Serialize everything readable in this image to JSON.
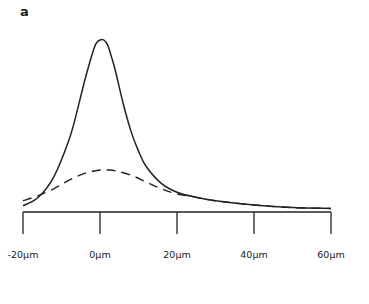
{
  "panel_label": "a",
  "chart_data": {
    "type": "line",
    "title": "",
    "xlabel": "",
    "ylabel": "",
    "x_ticks": [
      "-20µm",
      "0µm",
      "20µm",
      "40µm",
      "60µm"
    ],
    "x_tick_values": [
      -20,
      0,
      20,
      40,
      60
    ],
    "xlim": [
      -20,
      60
    ],
    "grid": false,
    "legend": null,
    "series": [
      {
        "name": "solid",
        "style": "solid",
        "x": [
          -20,
          -16,
          -12,
          -8,
          -6,
          -4,
          -2,
          -1,
          0,
          1,
          2,
          3,
          4,
          6,
          8,
          10,
          12,
          16,
          20,
          25,
          30,
          40,
          50,
          60
        ],
        "y": [
          0.03,
          0.08,
          0.2,
          0.42,
          0.58,
          0.76,
          0.92,
          0.98,
          1.0,
          1.0,
          0.97,
          0.9,
          0.82,
          0.63,
          0.47,
          0.35,
          0.26,
          0.16,
          0.11,
          0.08,
          0.06,
          0.035,
          0.02,
          0.015
        ]
      },
      {
        "name": "dashed",
        "style": "dashed",
        "x": [
          -20,
          -16,
          -12,
          -8,
          -4,
          0,
          2,
          4,
          8,
          12,
          16,
          20,
          25,
          30,
          40,
          50,
          60
        ],
        "y": [
          0.06,
          0.09,
          0.13,
          0.18,
          0.22,
          0.24,
          0.24,
          0.235,
          0.21,
          0.17,
          0.13,
          0.1,
          0.08,
          0.06,
          0.035,
          0.02,
          0.015
        ]
      }
    ]
  }
}
